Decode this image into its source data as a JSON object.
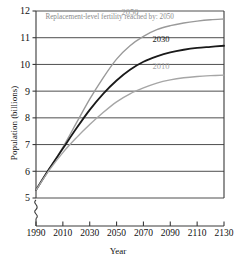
{
  "chart_data": {
    "type": "line",
    "title": "",
    "subtitle": "",
    "xlabel": "Year",
    "ylabel": "Population (billions)",
    "xlim": [
      1990,
      2130
    ],
    "ylim": [
      5,
      12
    ],
    "grid": true,
    "grid_orientation": "horizontal",
    "axis_break": {
      "axis": "y",
      "below": 5,
      "symbol": "squiggle"
    },
    "legend": {
      "position": "inline-curve-labels",
      "entries": [
        "2050",
        "2030",
        "2010"
      ]
    },
    "annotations": [
      {
        "name": "replacement-fertility-note",
        "text": "Replacement-level fertility reached by: 2050",
        "x": 1997,
        "y": 11.8
      }
    ],
    "xticks": [
      1990,
      2010,
      2030,
      2050,
      2070,
      2090,
      2110,
      2130
    ],
    "xticklabels": [
      "1990",
      "2010",
      "2030",
      "2050",
      "2070",
      "2090",
      "2110",
      "2130"
    ],
    "yticks": [
      5,
      6,
      7,
      8,
      9,
      10,
      11,
      12
    ],
    "yticklabels": [
      "5",
      "6",
      "7",
      "8",
      "9",
      "10",
      "11",
      "12"
    ],
    "x": [
      1990,
      2000,
      2010,
      2020,
      2030,
      2040,
      2050,
      2060,
      2070,
      2080,
      2090,
      2100,
      2110,
      2120,
      2130
    ],
    "series": [
      {
        "name": "2050",
        "label": "2050",
        "color": "#9a9a9a",
        "width": 1.4,
        "label_x": 2060,
        "label_y": 11.95,
        "values": [
          5.3,
          6.1,
          6.9,
          7.8,
          8.7,
          9.5,
          10.2,
          10.7,
          11.05,
          11.3,
          11.45,
          11.55,
          11.62,
          11.67,
          11.7
        ]
      },
      {
        "name": "2030",
        "label": "2030",
        "color": "#1a1a1a",
        "width": 1.8,
        "label_x": 2083,
        "label_y": 10.95,
        "values": [
          5.3,
          6.1,
          6.85,
          7.6,
          8.3,
          8.9,
          9.4,
          9.8,
          10.1,
          10.3,
          10.45,
          10.55,
          10.62,
          10.66,
          10.7
        ]
      },
      {
        "name": "2010",
        "label": "2010",
        "color": "#a6a6a6",
        "width": 1.4,
        "label_x": 2083,
        "label_y": 9.95,
        "values": [
          5.3,
          6.05,
          6.7,
          7.25,
          7.75,
          8.2,
          8.6,
          8.9,
          9.12,
          9.3,
          9.42,
          9.5,
          9.55,
          9.58,
          9.6
        ]
      }
    ],
    "colors": {
      "axis": "#3a3a3a",
      "gridline": "#3a3a3a",
      "annotation": "#8a8a8a",
      "label_2050": "#9a9a9a",
      "label_2030": "#1a1a1a",
      "label_2010": "#a6a6a6",
      "background": "#ffffff"
    }
  }
}
